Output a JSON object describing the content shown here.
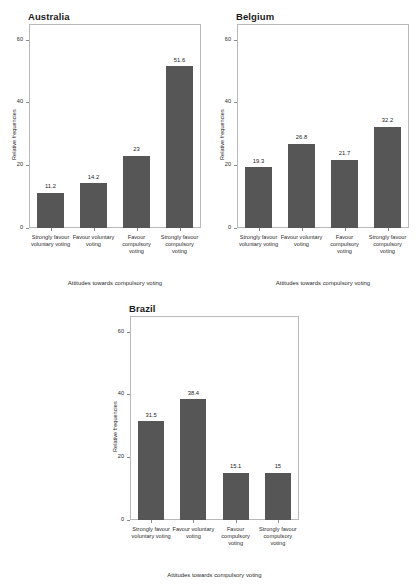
{
  "figure": {
    "categories": [
      "Strongly favour voluntary voting",
      "Favour voluntary voting",
      "Favour compulsory voting",
      "Strongly favour compulsory voting"
    ],
    "xlabel": "Attitudes towards compulsory voting",
    "ylabel": "Relative frequencies",
    "yticks": [
      "0",
      "20",
      "40",
      "60"
    ]
  },
  "chart_data": [
    {
      "type": "bar",
      "title": "Australia",
      "categories": [
        "Strongly favour voluntary voting",
        "Favour voluntary voting",
        "Favour compulsory voting",
        "Strongly favour compulsory voting"
      ],
      "values": [
        11.2,
        14.2,
        23,
        51.6
      ],
      "value_labels": [
        "11.2",
        "14.2",
        "23",
        "51.6"
      ],
      "xlabel": "Attitudes towards compulsory voting",
      "ylabel": "Relative frequencies",
      "ylim": [
        0,
        65
      ],
      "yticks": [
        0,
        20,
        40,
        60
      ],
      "grid": false,
      "legend": "none",
      "bar_color": "#565656"
    },
    {
      "type": "bar",
      "title": "Belgium",
      "categories": [
        "Strongly favour voluntary voting",
        "Favour voluntary voting",
        "Favour compulsory voting",
        "Strongly favour compulsory voting"
      ],
      "values": [
        19.3,
        26.8,
        21.7,
        32.2
      ],
      "value_labels": [
        "19.3",
        "26.8",
        "21.7",
        "32.2"
      ],
      "xlabel": "Attitudes towards compulsory voting",
      "ylabel": "Relative frequencies",
      "ylim": [
        0,
        65
      ],
      "yticks": [
        0,
        20,
        40,
        60
      ],
      "grid": false,
      "legend": "none",
      "bar_color": "#565656"
    },
    {
      "type": "bar",
      "title": "Brazil",
      "categories": [
        "Strongly favour voluntary voting",
        "Favour voluntary voting",
        "Favour compulsory voting",
        "Strongly favour compulsory voting"
      ],
      "values": [
        31.5,
        38.4,
        15.1,
        15
      ],
      "value_labels": [
        "31.5",
        "38.4",
        "15.1",
        "15"
      ],
      "xlabel": "Attitudes towards compulsory voting",
      "ylabel": "Relative frequencies",
      "ylim": [
        0,
        65
      ],
      "yticks": [
        0,
        20,
        40,
        60
      ],
      "grid": false,
      "legend": "none",
      "bar_color": "#565656"
    }
  ]
}
